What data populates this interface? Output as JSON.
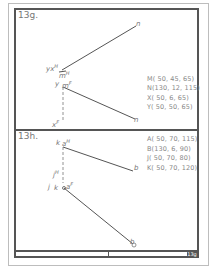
{
  "problem_g": {
    "label": "13g.",
    "coords": [
      "M( 50, 45, 65)",
      "N(130, 12, 115)",
      "X( 50,  6, 65)",
      "Y( 50, 50, 65)"
    ],
    "points": {
      "yxH": "yx",
      "yxH_sup": "H",
      "mH": "m",
      "mH_sup": "H",
      "ymF": "y",
      "mF": "m",
      "mF_sup": "F",
      "xF": "x",
      "xF_sup": "F",
      "nH": "n",
      "nF": "n"
    }
  },
  "problem_h": {
    "label": "13h.",
    "coords": [
      "A( 50, 70, 115)",
      "B(130,  6, 90)",
      "J( 50, 70, 80)",
      "K( 50, 70, 120)"
    ],
    "points": {
      "kH": "k",
      "aH": "a",
      "aH_sup": "H",
      "bH": "b",
      "jH": "j",
      "jH_sup": "H",
      "jF": "j",
      "kF": "k",
      "aF": "a",
      "aF_sup": "F",
      "bF": "b"
    }
  },
  "title_block": {
    "sheet_number": "13g"
  },
  "colors": {
    "frame": "#555555",
    "outer_frame": "#bdbdbd",
    "line": "#555555",
    "text": "#777777"
  }
}
